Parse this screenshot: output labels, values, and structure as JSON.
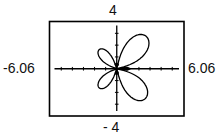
{
  "chart_data": {
    "type": "line",
    "subtype": "polar-rose",
    "title": "",
    "xlabel": "",
    "ylabel": "",
    "window": {
      "xmin": -6.06,
      "xmax": 6.06,
      "ymin": -4,
      "ymax": 4,
      "xscl": 1,
      "yscl": 1
    },
    "xlim": [
      -6.06,
      6.06
    ],
    "ylim": [
      -4,
      4
    ],
    "grid": false,
    "axes": true,
    "tick_labels": {
      "top": "4",
      "bottom": "- 4",
      "left": "-6.06",
      "right": "6.06"
    },
    "petals": [
      {
        "name": "upper-right",
        "tip": [
          2.7,
          2.7
        ],
        "size": "large"
      },
      {
        "name": "lower-right",
        "tip": [
          2.6,
          -2.5
        ],
        "size": "large"
      },
      {
        "name": "upper-left",
        "tip": [
          -1.6,
          1.6
        ],
        "size": "small"
      },
      {
        "name": "lower-left",
        "tip": [
          -1.6,
          -1.6
        ],
        "size": "small"
      },
      {
        "name": "x-axis-spike",
        "tip": [
          1.2,
          0.0
        ],
        "size": "tiny"
      }
    ],
    "series": [
      {
        "name": "polar curve",
        "color": "#000000"
      }
    ]
  },
  "labels": {
    "ymax": "4",
    "ymin": "- 4",
    "xmin": "-6.06",
    "xmax": "6.06"
  },
  "colors": {
    "frame": "#000000",
    "axes": "#000000",
    "curve": "#000000",
    "background": "#ffffff"
  }
}
